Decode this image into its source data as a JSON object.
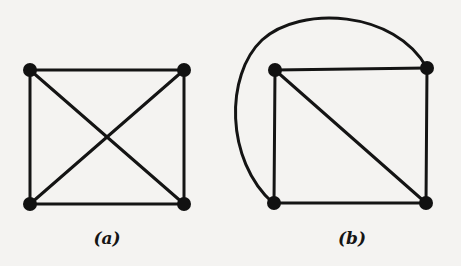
{
  "figure": {
    "colors": {
      "ink": "#141414",
      "background": "#f4f3f1"
    },
    "graphs": [
      {
        "id": "a",
        "caption": "(a)",
        "vertices": [
          "top-left",
          "top-right",
          "bottom-left",
          "bottom-right"
        ],
        "edges": [
          [
            "top-left",
            "top-right"
          ],
          [
            "bottom-left",
            "bottom-right"
          ],
          [
            "top-left",
            "bottom-left"
          ],
          [
            "top-right",
            "bottom-right"
          ],
          [
            "top-left",
            "bottom-right"
          ],
          [
            "top-right",
            "bottom-left"
          ]
        ],
        "crossings": 1
      },
      {
        "id": "b",
        "caption": "(b)",
        "vertices": [
          "top-left",
          "top-right",
          "bottom-left",
          "bottom-right"
        ],
        "edges": [
          [
            "top-left",
            "top-right"
          ],
          [
            "bottom-left",
            "bottom-right"
          ],
          [
            "top-left",
            "bottom-left"
          ],
          [
            "top-right",
            "bottom-right"
          ],
          [
            "top-left",
            "bottom-right"
          ],
          [
            "top-right",
            "bottom-left",
            "curved-outer-arc"
          ]
        ],
        "crossings": 0
      }
    ]
  }
}
